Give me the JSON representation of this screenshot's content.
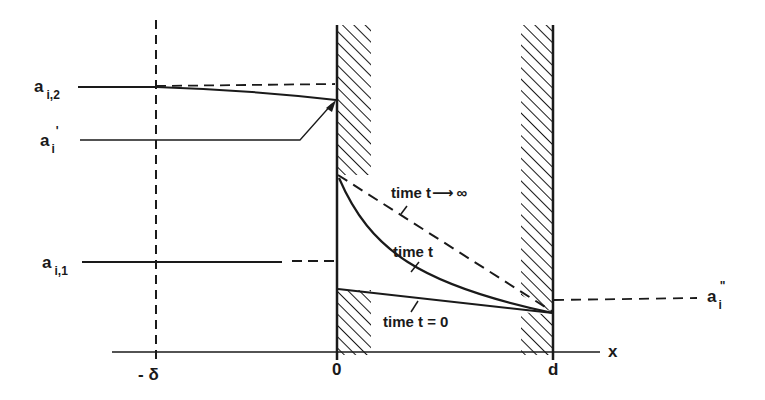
{
  "figure": {
    "colors": {
      "ink": "#1a1a1a",
      "background": "#ffffff"
    }
  },
  "axis": {
    "x_label": "x",
    "ticks": [
      "- δ",
      "0",
      "d"
    ]
  },
  "left_labels": {
    "a_i2": {
      "base": "a",
      "sub": "i,2"
    },
    "a_i_prime": {
      "base": "a",
      "sub": "i",
      "sup": "'"
    },
    "a_i1": {
      "base": "a",
      "sub": "i,1"
    }
  },
  "right_label": {
    "a_i_double_prime": {
      "base": "a",
      "sub": "i",
      "sup": "\""
    }
  },
  "curves": {
    "t_infinity": {
      "label": "time  t",
      "arrow": "⟶",
      "limit": "∞"
    },
    "t_general": {
      "label": "time  t"
    },
    "t_zero": {
      "label": "time  t = 0"
    }
  },
  "regions": {
    "membrane_left_wall": "hatched",
    "membrane_right_wall": "hatched"
  }
}
